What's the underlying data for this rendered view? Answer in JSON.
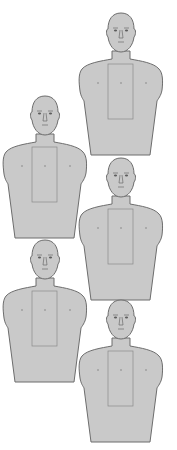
{
  "colors": {
    "background": "#ffffff",
    "silhouette_fill": "#c9c9c9",
    "silhouette_outline": "#6d6d6d",
    "zone_outline": "#8a8a8a"
  },
  "targets": [
    {
      "id": 1,
      "cx": 121,
      "top": 13
    },
    {
      "id": 2,
      "cx": 45,
      "top": 96
    },
    {
      "id": 3,
      "cx": 121,
      "top": 158
    },
    {
      "id": 4,
      "cx": 45,
      "top": 240
    },
    {
      "id": 5,
      "cx": 121,
      "top": 300
    }
  ]
}
